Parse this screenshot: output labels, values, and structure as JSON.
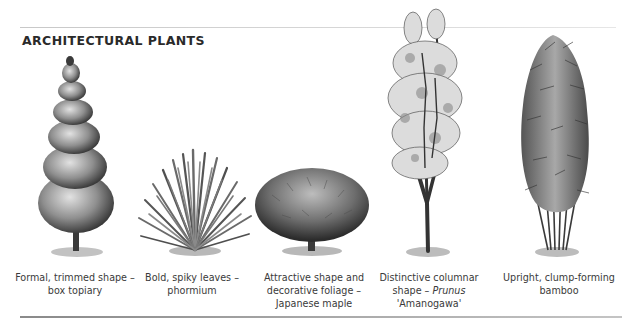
{
  "page": {
    "title": "ARCHITECTURAL PLANTS"
  },
  "plants": [
    {
      "id": "box-topiary",
      "illustration": "spiral-topiary-illustration",
      "caption_lines": [
        "Formal, trimmed shape –",
        "box topiary"
      ]
    },
    {
      "id": "phormium",
      "illustration": "spiky-phormium-illustration",
      "caption_lines": [
        "Bold, spiky leaves –",
        "phormium"
      ]
    },
    {
      "id": "japanese-maple",
      "illustration": "dome-maple-illustration",
      "caption_lines": [
        "Attractive shape and",
        "decorative foliage –",
        "Japanese maple"
      ]
    },
    {
      "id": "prunus-amanogawa",
      "illustration": "columnar-cherry-illustration",
      "caption_lines": [
        "Distinctive columnar",
        "shape – ",
        "Prunus",
        "'Amanogawa'"
      ]
    },
    {
      "id": "bamboo",
      "illustration": "upright-bamboo-illustration",
      "caption_lines": [
        "Upright, clump-forming",
        "bamboo"
      ]
    }
  ],
  "colors": {
    "ink": "#2b2b2b",
    "foliage_dark": "#3c3c3c",
    "foliage_mid": "#7a7a7a",
    "foliage_light": "#c9c9c9",
    "shadow": "#b5b5b5",
    "rule": "#9a9a9a"
  }
}
